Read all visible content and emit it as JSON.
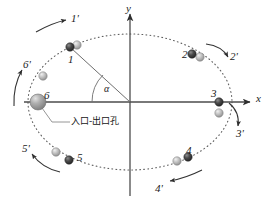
{
  "figure": {
    "kind": "orbit-diagram",
    "background": "#ffffff",
    "ink": "#2b2b2b",
    "colors": {
      "axis": "#4a4a4a",
      "orbit_dotted": "#6b6b6b",
      "arrow": "#3a3a3a",
      "sphere_dark": "#3d3d3d",
      "sphere_light": "#b9b9b9",
      "sphere_big": "#9a9a9a",
      "leader": "#7a7a7a"
    },
    "axes": {
      "x_label": "x",
      "y_label": "y",
      "origin": {
        "x": 130,
        "y": 102
      }
    },
    "angle": {
      "symbol": "α",
      "label": "α"
    },
    "annotation": {
      "text": "入口-出口孔",
      "leader_from": {
        "x": 44,
        "y": 108
      },
      "leader_to": {
        "x": 66,
        "y": 121
      }
    },
    "ellipse": {
      "cx": 130,
      "cy": 102,
      "rx": 102,
      "ry": 68,
      "style": "dotted"
    },
    "positions": [
      {
        "id": "1",
        "label": "1",
        "label_x": 68,
        "label_y": 54,
        "dark": {
          "x": 70,
          "y": 47,
          "r": 4
        },
        "light": {
          "x": 77,
          "y": 45,
          "r": 4
        }
      },
      {
        "id": "2",
        "label": "2",
        "label_x": 182,
        "label_y": 50,
        "dark": {
          "x": 192,
          "y": 54,
          "r": 4
        },
        "light": {
          "x": 200,
          "y": 57,
          "r": 4
        }
      },
      {
        "id": "3",
        "label": "3",
        "label_x": 211,
        "label_y": 89,
        "dark": {
          "x": 219,
          "y": 102,
          "r": 4
        },
        "light": {
          "x": 219,
          "y": 113,
          "r": 4
        }
      },
      {
        "id": "4",
        "label": "4",
        "label_x": 186,
        "label_y": 147,
        "dark": {
          "x": 188,
          "y": 157,
          "r": 4
        },
        "light": {
          "x": 177,
          "y": 161,
          "r": 4
        }
      },
      {
        "id": "5",
        "label": "5",
        "label_x": 77,
        "label_y": 153,
        "dark": {
          "x": 69,
          "y": 160,
          "r": 4
        },
        "light": {
          "x": 56,
          "y": 152,
          "r": 4
        }
      },
      {
        "id": "6",
        "label": "6",
        "label_x": 44,
        "label_y": 92,
        "dark": {
          "x": 38,
          "y": 102,
          "r": 8
        },
        "light": {
          "x": 43,
          "y": 76,
          "r": 4
        }
      }
    ],
    "arrows": [
      {
        "id": "1p",
        "label": "1'",
        "label_x": 74,
        "label_y": 16
      },
      {
        "id": "2p",
        "label": "2'",
        "label_x": 231,
        "label_y": 52
      },
      {
        "id": "3p",
        "label": "3'",
        "label_x": 237,
        "label_y": 131
      },
      {
        "id": "4p",
        "label": "4'",
        "label_x": 157,
        "label_y": 186
      },
      {
        "id": "5p",
        "label": "5'",
        "label_x": 23,
        "label_y": 146
      },
      {
        "id": "6p",
        "label": "6'",
        "label_x": 24,
        "label_y": 62
      }
    ]
  }
}
